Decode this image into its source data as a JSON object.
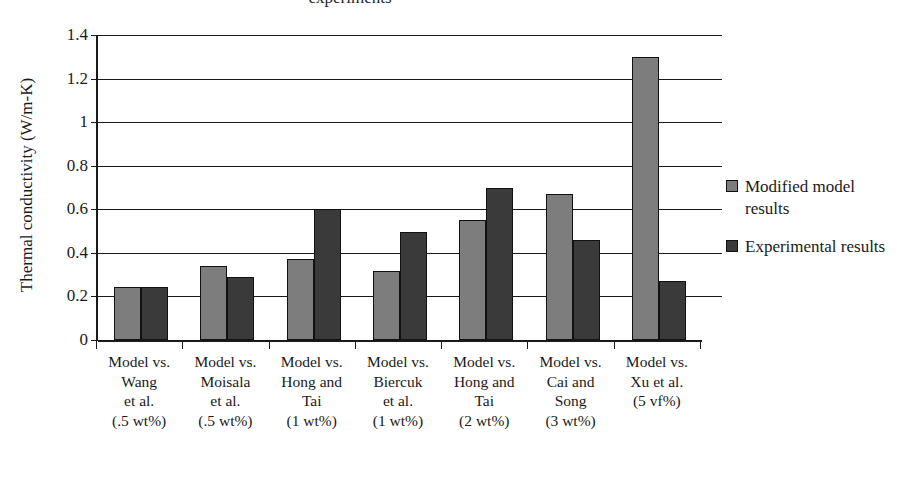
{
  "chart_data": {
    "type": "bar",
    "title": "experiments",
    "xlabel": "",
    "ylabel": "Thermal conductivity (W/m-K)",
    "ylim": [
      0,
      1.4
    ],
    "ytick_labels": [
      "1.4",
      "1.2",
      "1",
      "0.8",
      "0.6",
      "0.4",
      "0.2",
      "0"
    ],
    "ytick_values": [
      1.4,
      1.2,
      1.0,
      0.8,
      0.6,
      0.4,
      0.2,
      0
    ],
    "grid": true,
    "legend_position": "right",
    "categories": [
      "Model vs. Wang et al. (.5 wt%)",
      "Model vs. Moisala et al. (.5 wt%)",
      "Model vs. Hong and Tai (1 wt%)",
      "Model vs. Biercuk et al. (1 wt%)",
      "Model vs. Hong and Tai (2 wt%)",
      "Model vs. Cai and Song (3 wt%)",
      "Model vs. Xu et al. (5 vf%)"
    ],
    "category_lines": [
      [
        "Model vs.",
        "Wang",
        "et al.",
        "(.5 wt%)"
      ],
      [
        "Model vs.",
        "Moisala",
        "et al.",
        "(.5 wt%)"
      ],
      [
        "Model vs.",
        "Hong and",
        "Tai",
        "(1 wt%)"
      ],
      [
        "Model vs.",
        "Biercuk",
        "et al.",
        "(1 wt%)"
      ],
      [
        "Model vs.",
        "Hong and",
        "Tai",
        "(2 wt%)"
      ],
      [
        "Model vs.",
        "Cai and",
        "Song",
        "(3 wt%)"
      ],
      [
        "Model vs.",
        "Xu et al.",
        "(5 vf%)",
        ""
      ]
    ],
    "series": [
      {
        "name": "Modified model results",
        "color": "#7d7d7d",
        "values": [
          0.245,
          0.34,
          0.37,
          0.315,
          0.55,
          0.67,
          1.3
        ]
      },
      {
        "name": "Experimental results",
        "color": "#3a3a3a",
        "values": [
          0.245,
          0.29,
          0.6,
          0.495,
          0.7,
          0.46,
          0.27
        ]
      }
    ]
  },
  "legend": {
    "entries": [
      {
        "label": "Modified model results"
      },
      {
        "label": "Experimental results"
      }
    ]
  }
}
